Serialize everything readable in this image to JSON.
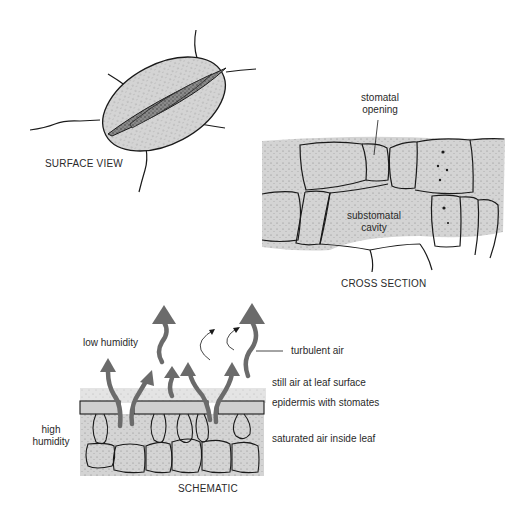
{
  "surface_view": {
    "caption": "SURFACE VIEW"
  },
  "cross_section": {
    "caption": "CROSS SECTION",
    "label_opening_1": "stomatal",
    "label_opening_2": "opening",
    "label_cavity_1": "substomatal",
    "label_cavity_2": "cavity"
  },
  "schematic": {
    "caption": "SCHEMATIC",
    "low_humidity": "low humidity",
    "high_humidity_1": "high",
    "high_humidity_2": "humidity",
    "turbulent_air": "turbulent air",
    "still_air": "still air at leaf surface",
    "epidermis": "epidermis with stomates",
    "saturated_air": "saturated air inside leaf"
  },
  "colors": {
    "cell_fill": "#d4d4d4",
    "outline": "#1a1a1a",
    "dark_slit": "#6e6e6e",
    "arrow": "#6b6b6b"
  }
}
